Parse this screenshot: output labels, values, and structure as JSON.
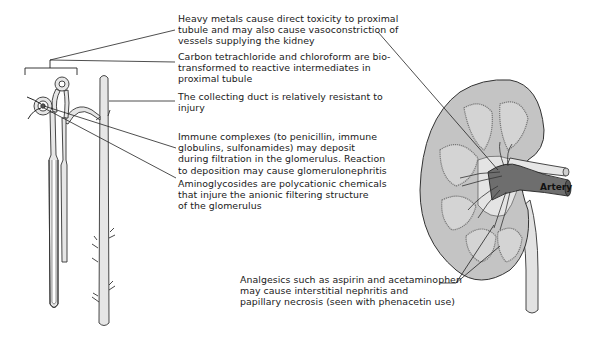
{
  "figure": {
    "type": "anatomical-diagram"
  },
  "labels": {
    "heavy_metals": "Heavy metals cause direct toxicity to proximal\ntubule and may also cause vasoconstriction of\nvessels supplying the kidney",
    "carbon_tetrachloride": "Carbon tetrachloride and chloroform are bio-\ntransformed to reactive intermediates in\nproximal tubule",
    "collecting_duct": "The collecting duct is relatively resistant to\ninjury",
    "immune_complexes": "Immune complexes (to penicillin, immune\nglobulins, sulfonamides) may deposit\nduring filtration in the glomerulus. Reaction\nto deposition may cause glomerulonephritis",
    "aminoglycosides": "Aminoglycosides are polycationic chemicals\nthat injure the anionic filtering structure\nof the glomerulus",
    "analgesics": "Analgesics such as aspirin and acetaminophen\nmay cause interstitial nephritis and\npapillary necrosis (seen with phenacetin use)",
    "artery": "Artery"
  },
  "colors": {
    "kidney_fill": "#c4c4c4",
    "medulla_fill": "#d6d6d6",
    "vessel_dark": "#6e6e6e",
    "tubule_fill": "#e6e6e6",
    "line": "#222222"
  }
}
